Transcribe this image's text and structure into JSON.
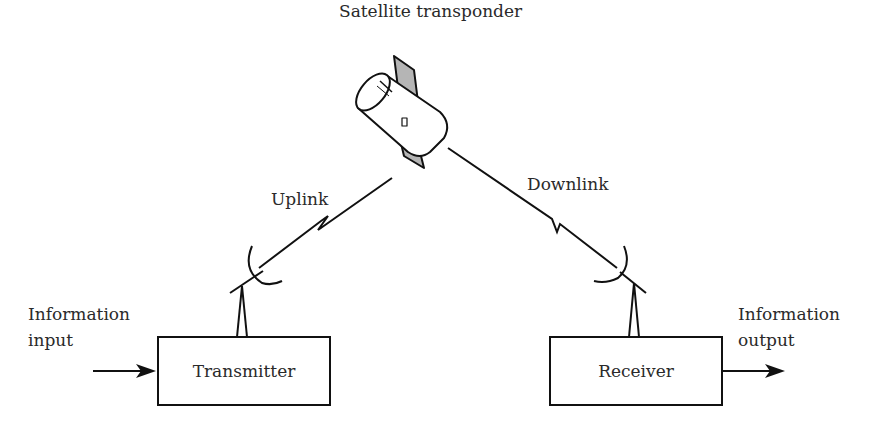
{
  "diagram": {
    "type": "satellite communication link",
    "satellite": {
      "label": "Satellite transponder",
      "icon": "satellite-icon"
    },
    "links": [
      {
        "label": "Uplink",
        "from": "Transmitter",
        "to": "Satellite transponder",
        "icon": "lightning-zigzag-icon"
      },
      {
        "label": "Downlink",
        "from": "Satellite transponder",
        "to": "Receiver",
        "icon": "lightning-zigzag-icon"
      }
    ],
    "blocks": [
      {
        "label": "Transmitter",
        "antenna": "dish-antenna-icon"
      },
      {
        "label": "Receiver",
        "antenna": "dish-antenna-icon"
      }
    ],
    "input": {
      "line1": "Information",
      "line2": "input"
    },
    "output": {
      "line1": "Information",
      "line2": "output"
    }
  }
}
